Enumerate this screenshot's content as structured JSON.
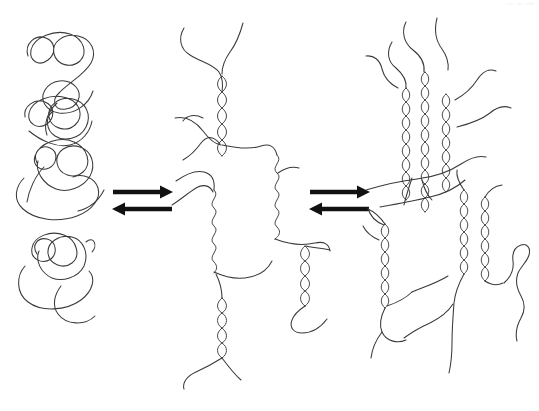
{
  "figure": {
    "background_color": "#ffffff",
    "stroke_color": "#3a3a3a",
    "arrow_color": "#111111",
    "width": 539,
    "height": 411
  },
  "stages": [
    {
      "id": "stage-1",
      "name": "random-coils",
      "label": "Random coils",
      "description": "Four separate disordered polymer chains in solution",
      "chain_count": 4,
      "helix_count": 0
    },
    {
      "id": "stage-2",
      "name": "partial-helices",
      "label": "Partially helical network",
      "description": "Chains associate into isolated double-helical junction zones linked by flexible coil segments",
      "chain_count": 4,
      "helix_count": 3,
      "wavy_segment_count": 2
    },
    {
      "id": "stage-3",
      "name": "aggregated-bundles",
      "label": "Aggregated helix bundles",
      "description": "Double helices laterally aggregate into multi-strand bundles forming a network gel",
      "chain_count": 6,
      "helix_count": 6,
      "bundle_sizes": [
        3,
        2,
        1
      ]
    }
  ],
  "arrows": [
    {
      "id": "arrow-pair-1",
      "name": "equilibrium-arrows-left",
      "forward_label": "",
      "reverse_label": "",
      "direction": "bidirectional",
      "x_start": 113,
      "x_end": 172,
      "y_forward": 192,
      "y_reverse": 209
    },
    {
      "id": "arrow-pair-2",
      "name": "equilibrium-arrows-right",
      "forward_label": "",
      "reverse_label": "",
      "direction": "bidirectional",
      "x_start": 310,
      "x_end": 369,
      "y_forward": 192,
      "y_reverse": 209
    }
  ],
  "geometry": {
    "coils": [
      "M30,57 C26,44 38,36 47,41 C55,45 53,57 46,62 C38,68 30,62 33,52 C38,38 58,31 72,36 C86,41 88,56 79,63 C70,70 56,65 53,54 C50,42 62,33 76,35 C90,37 95,49 90,60 C85,72 69,80 58,90 C48,99 53,110 65,108 C78,106 82,93 75,85 C66,75 50,78 44,88 C38,98 45,110 58,112 C74,114 88,103 92,90",
      "M26,117 C24,106 36,99 45,103 C54,107 53,118 46,123 C37,129 27,124 29,114 C32,101 52,94 66,99 C80,104 82,118 73,126 C64,133 50,128 48,117 C46,105 59,97 72,100 C85,103 91,116 85,127 C79,138 64,140 55,134 C46,128 46,117 53,111 M30,131 C42,140 56,146 68,143 C80,140 88,131 90,121 M56,104 C48,112 44,124 48,134",
      "M38,164 C33,153 42,145 51,149 C60,153 58,165 50,169 C41,173 33,166 36,157 C41,143 60,137 74,143 C88,149 91,164 82,172 C73,180 58,175 56,163 C54,151 67,144 79,148 C91,152 95,165 89,176 C82,188 66,192 55,188 C42,183 35,170 38,160 M25,177 C16,185 14,199 23,208 C34,219 57,222 76,215 C92,209 100,197 97,187 C94,177 82,172 72,176 M44,168 C36,176 30,189 28,201 M103,191 C98,200 89,207 78,210",
      "M38,255 C32,246 39,238 48,240 C57,242 58,254 51,259 C42,265 31,259 32,249 C34,237 51,231 64,236 C77,241 80,256 71,263 C62,270 49,264 48,253 C47,242 59,235 71,238 C83,241 88,254 83,265 C77,277 62,281 52,277 C41,272 36,260 40,250 M26,266 C17,276 17,292 28,301 C41,311 65,310 80,299 C92,290 95,277 88,270 M61,285 C54,294 52,305 58,313 C66,324 84,325 94,316 M85,243 C93,236 97,246 92,252"
    ]
  }
}
